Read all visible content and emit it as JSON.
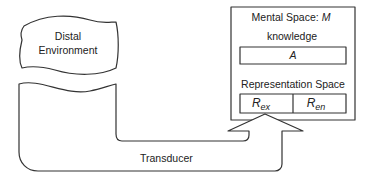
{
  "diagram": {
    "distal_environment": {
      "line1": "Distal",
      "line2": "Environment"
    },
    "mental_space": {
      "title": "Mental Space: ",
      "title_symbol": "M",
      "knowledge_label": "knowledge",
      "knowledge_value": "A",
      "representation_label": "Representation Space",
      "r_ex": {
        "base": "R",
        "sub": "ex"
      },
      "r_en": {
        "base": "R",
        "sub": "en"
      }
    },
    "transducer": {
      "label": "Transducer"
    },
    "colors": {
      "stroke": "#333333",
      "background": "#ffffff"
    }
  }
}
